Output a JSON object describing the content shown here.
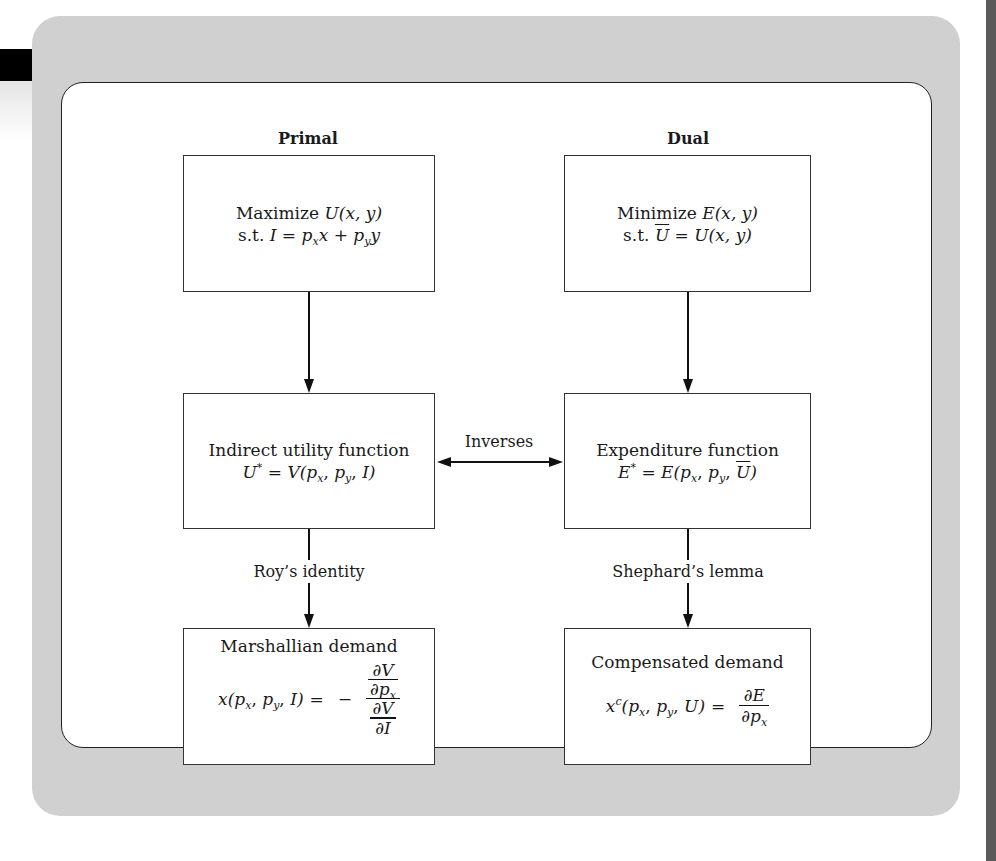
{
  "diagram": {
    "headings": {
      "primal": "Primal",
      "dual": "Dual"
    },
    "primal_problem": {
      "line1_text": "Maximize ",
      "line1_math": "U(x, y)",
      "line2_text": "s.t. ",
      "line2_math_I": "I",
      "line2_eq": " = ",
      "line2_px": "p",
      "line2_px_sub": "x",
      "line2_x": "x",
      "line2_plus": " + ",
      "line2_py": "p",
      "line2_py_sub": "y",
      "line2_y": "y"
    },
    "dual_problem": {
      "line1_text": "Minimize ",
      "line1_math": "E(x, y)",
      "line2_text": "s.t. ",
      "line2_ubar": "U",
      "line2_rest": " = U(x, y)"
    },
    "indirect_utility": {
      "title": "Indirect utility function",
      "lhs": "U",
      "star": "*",
      "eq": " = V(",
      "p1": "p",
      "p1_sub": "x",
      "comma1": ", ",
      "p2": "p",
      "p2_sub": "y",
      "comma2": ", ",
      "arg3": "I",
      "close": ")"
    },
    "expenditure_function": {
      "title": "Expenditure function",
      "lhs": "E",
      "star": "*",
      "eq": " = E(",
      "p1": "p",
      "p1_sub": "x",
      "comma1": ", ",
      "p2": "p",
      "p2_sub": "y",
      "comma2": ", ",
      "ubar": "U",
      "close": ")"
    },
    "link_label": "Inverses",
    "edge_labels": {
      "left": "Roy’s identity",
      "right": "Shephard’s lemma"
    },
    "marshallian_demand": {
      "title": "Marshallian demand",
      "lhs_x": "x(",
      "p1": "p",
      "p1_sub": "x",
      "comma1": ", ",
      "p2": "p",
      "p2_sub": "y",
      "comma2": ", ",
      "arg3": "I",
      "close": ")",
      "eq": "=",
      "minus": "−",
      "top_num": "∂V",
      "top_den_d": "∂p",
      "top_den_sub": "x",
      "bot_num": "∂V",
      "bot_den": "∂I"
    },
    "compensated_demand": {
      "title": "Compensated demand",
      "lhs_x": "x",
      "lhs_sup": "c",
      "open": "(",
      "p1": "p",
      "p1_sub": "x",
      "comma1": ", ",
      "p2": "p",
      "p2_sub": "y",
      "comma2": ", ",
      "arg3": "U",
      "close": ")",
      "eq": "=",
      "num": "∂E",
      "den_d": "∂p",
      "den_sub": "x"
    }
  },
  "colors": {
    "frame_gray": "#d0d0d0",
    "line": "#111111",
    "page_edge": "#5a5a5a"
  }
}
